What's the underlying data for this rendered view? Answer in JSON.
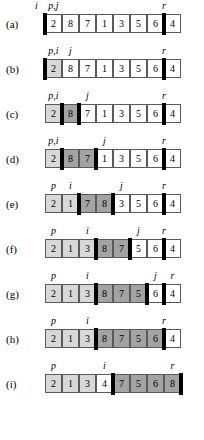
{
  "figure": {
    "cell_width": 17,
    "array_left": 45,
    "rows": [
      {
        "id": "a",
        "label": "(a)",
        "values": [
          "2",
          "8",
          "7",
          "1",
          "3",
          "5",
          "6",
          "4"
        ],
        "shades": [
          "white",
          "white",
          "white",
          "white",
          "white",
          "white",
          "white",
          "white"
        ],
        "bars": [
          0,
          7
        ],
        "pointers": [
          {
            "text": "i",
            "slot": -1,
            "align": "cell"
          },
          {
            "text": "p,j",
            "slot": 0,
            "align": "cell"
          },
          {
            "text": "r",
            "slot": 7,
            "align": "bar"
          }
        ]
      },
      {
        "id": "b",
        "label": "(b)",
        "values": [
          "2",
          "8",
          "7",
          "1",
          "3",
          "5",
          "6",
          "4"
        ],
        "shades": [
          "light",
          "white",
          "white",
          "white",
          "white",
          "white",
          "white",
          "white"
        ],
        "bars": [
          0,
          7
        ],
        "pointers": [
          {
            "text": "p,i",
            "slot": 0,
            "align": "cell"
          },
          {
            "text": "j",
            "slot": 1,
            "align": "cell"
          },
          {
            "text": "r",
            "slot": 7,
            "align": "bar"
          }
        ]
      },
      {
        "id": "c",
        "label": "(c)",
        "values": [
          "2",
          "8",
          "7",
          "1",
          "3",
          "5",
          "6",
          "4"
        ],
        "shades": [
          "light",
          "dark",
          "white",
          "white",
          "white",
          "white",
          "white",
          "white"
        ],
        "bars": [
          1,
          2,
          7
        ],
        "pointers": [
          {
            "text": "p,i",
            "slot": 0,
            "align": "cell"
          },
          {
            "text": "j",
            "slot": 2,
            "align": "cell"
          },
          {
            "text": "r",
            "slot": 7,
            "align": "bar"
          }
        ]
      },
      {
        "id": "d",
        "label": "(d)",
        "values": [
          "2",
          "8",
          "7",
          "1",
          "3",
          "5",
          "6",
          "4"
        ],
        "shades": [
          "light",
          "dark",
          "dark",
          "white",
          "white",
          "white",
          "white",
          "white"
        ],
        "bars": [
          1,
          3,
          7
        ],
        "pointers": [
          {
            "text": "p,i",
            "slot": 0,
            "align": "cell"
          },
          {
            "text": "j",
            "slot": 3,
            "align": "cell"
          },
          {
            "text": "r",
            "slot": 7,
            "align": "bar"
          }
        ]
      },
      {
        "id": "e",
        "label": "(e)",
        "values": [
          "2",
          "1",
          "7",
          "8",
          "3",
          "5",
          "6",
          "4"
        ],
        "shades": [
          "light",
          "light",
          "dark",
          "dark",
          "white",
          "white",
          "white",
          "white"
        ],
        "bars": [
          2,
          4,
          7
        ],
        "pointers": [
          {
            "text": "p",
            "slot": 0,
            "align": "cell"
          },
          {
            "text": "i",
            "slot": 1,
            "align": "cell"
          },
          {
            "text": "j",
            "slot": 4,
            "align": "cell"
          },
          {
            "text": "r",
            "slot": 7,
            "align": "bar"
          }
        ]
      },
      {
        "id": "f",
        "label": "(f)",
        "values": [
          "2",
          "1",
          "3",
          "8",
          "7",
          "5",
          "6",
          "4"
        ],
        "shades": [
          "light",
          "light",
          "light",
          "dark",
          "dark",
          "white",
          "white",
          "white"
        ],
        "bars": [
          3,
          5,
          7
        ],
        "pointers": [
          {
            "text": "p",
            "slot": 0,
            "align": "cell"
          },
          {
            "text": "i",
            "slot": 2,
            "align": "cell"
          },
          {
            "text": "j",
            "slot": 5,
            "align": "cell"
          },
          {
            "text": "r",
            "slot": 7,
            "align": "bar"
          }
        ]
      },
      {
        "id": "g",
        "label": "(g)",
        "values": [
          "2",
          "1",
          "3",
          "8",
          "7",
          "5",
          "6",
          "4"
        ],
        "shades": [
          "light",
          "light",
          "light",
          "dark",
          "dark",
          "dark",
          "white",
          "white"
        ],
        "bars": [
          3,
          6,
          7
        ],
        "pointers": [
          {
            "text": "p",
            "slot": 0,
            "align": "cell"
          },
          {
            "text": "i",
            "slot": 2,
            "align": "cell"
          },
          {
            "text": "j",
            "slot": 6,
            "align": "cell"
          },
          {
            "text": "r",
            "slot": 7,
            "align": "cell"
          }
        ]
      },
      {
        "id": "h",
        "label": "(h)",
        "values": [
          "2",
          "1",
          "3",
          "8",
          "7",
          "5",
          "6",
          "4"
        ],
        "shades": [
          "light",
          "light",
          "light",
          "dark",
          "dark",
          "dark",
          "dark",
          "white"
        ],
        "bars": [
          3,
          7
        ],
        "pointers": [
          {
            "text": "p",
            "slot": 0,
            "align": "cell"
          },
          {
            "text": "i",
            "slot": 2,
            "align": "cell"
          },
          {
            "text": "r",
            "slot": 7,
            "align": "bar"
          }
        ]
      },
      {
        "id": "i",
        "label": "(i)",
        "values": [
          "2",
          "1",
          "3",
          "4",
          "7",
          "5",
          "6",
          "8"
        ],
        "shades": [
          "light",
          "light",
          "light",
          "white",
          "dark",
          "dark",
          "dark",
          "dark"
        ],
        "bars": [
          4,
          8
        ],
        "pointers": [
          {
            "text": "p",
            "slot": 0,
            "align": "cell"
          },
          {
            "text": "i",
            "slot": 3,
            "align": "cell"
          },
          {
            "text": "r",
            "slot": 7,
            "align": "cell"
          }
        ]
      }
    ]
  }
}
